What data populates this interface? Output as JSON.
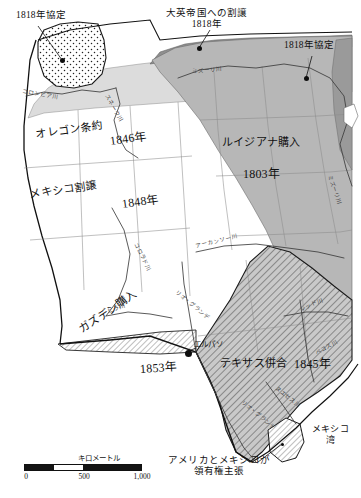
{
  "map": {
    "title_context": "United States territorial acquisitions map (Japanese)",
    "callouts": [
      {
        "id": "treaty-1818-nw",
        "line1": "1818年協定",
        "line2": "",
        "x": 16,
        "y": 10
      },
      {
        "id": "cession-to-britain",
        "line1": "大英帝国への割譲",
        "line2": "1818年",
        "x": 168,
        "y": 9
      },
      {
        "id": "treaty-1818-ne",
        "line1": "1818年協定",
        "line2": "",
        "x": 286,
        "y": 40
      },
      {
        "id": "us-mexico-claim",
        "line1": "アメリカとメキシコが",
        "line2": "領有権主張",
        "x": 178,
        "y": 455
      }
    ],
    "regions": [
      {
        "id": "oregon-treaty",
        "name": "オレゴン条約",
        "year": "1846年",
        "name_x": 36,
        "name_y": 126,
        "year_x": 108,
        "year_y": 133
      },
      {
        "id": "louisiana-purchase",
        "name": "ルイジアナ購入",
        "year": "1803年",
        "name_x": 224,
        "name_y": 139,
        "year_x": 244,
        "year_y": 170
      },
      {
        "id": "mexican-cession",
        "name": "メキシコ割譲",
        "year": "1848年",
        "name_x": 30,
        "name_y": 188,
        "year_x": 122,
        "year_y": 196
      },
      {
        "id": "gadsden-purchase",
        "name": "ガズデン購入",
        "year": "1853年",
        "name_x": 78,
        "name_y": 325,
        "year_x": 138,
        "year_y": 364
      },
      {
        "id": "texas-annexation",
        "name": "テキサス併合",
        "year": "1845年",
        "name_x": 222,
        "name_y": 360,
        "year_x": 294,
        "year_y": 360
      }
    ],
    "cities": [
      {
        "id": "el-paso",
        "label": "エルパソ",
        "x": 196,
        "y": 343,
        "dot_x": 189,
        "dot_y": 353
      }
    ],
    "water": [
      {
        "id": "gulf-of-mexico",
        "line1": "メキシコ",
        "line2": "湾",
        "x": 314,
        "y": 428
      }
    ],
    "rivers": [
      {
        "id": "columbia-river",
        "label": "コロンビア川",
        "x": 22,
        "y": 88,
        "rot": "rot-13"
      },
      {
        "id": "missouri-river-north",
        "label": "ミズーリ川",
        "x": 192,
        "y": 68,
        "rot": "rot-10"
      },
      {
        "id": "missouri-river-east",
        "label": "ミズーリ川",
        "x": 330,
        "y": 178,
        "rot": "rot-11"
      },
      {
        "id": "snake-river",
        "label": "スネーク川",
        "x": 104,
        "y": 92,
        "rot": "rot-4"
      },
      {
        "id": "arkansas-river",
        "label": "アーカンソー川",
        "x": 196,
        "y": 243,
        "rot": "rot-8"
      },
      {
        "id": "red-river",
        "label": "レッド川",
        "x": 300,
        "y": 310,
        "rot": "rot-6"
      },
      {
        "id": "colorado-river",
        "label": "コロラド川",
        "x": 137,
        "y": 243,
        "rot": "rot-7"
      },
      {
        "id": "gila-river",
        "label": "ヒラ川",
        "x": 108,
        "y": 310,
        "rot": "rot-1"
      },
      {
        "id": "rio-grande-north",
        "label": "リオ・グランデ",
        "x": 176,
        "y": 290,
        "rot": "rot-9"
      },
      {
        "id": "rio-grande-south",
        "label": "リオ・グランデ",
        "x": 242,
        "y": 400,
        "rot": "rot-9"
      },
      {
        "id": "nueces-river",
        "label": "ヌエセス川",
        "x": 276,
        "y": 386,
        "rot": "rot-9"
      },
      {
        "id": "pecos-river",
        "label": "ペコス川",
        "x": 316,
        "y": 352,
        "rot": "rot-12"
      }
    ],
    "scale": {
      "unit_label": "キロメートル",
      "ticks": [
        "0",
        "500",
        "1,000"
      ]
    },
    "colors": {
      "louisiana_fill": "#b7b7b7",
      "oregon_treaty_fill": "#dcdcdc",
      "mexican_cession_fill": "#ffffff",
      "british_cession_fill": "#8f8f8f",
      "far_east_fill": "#9a9a9a",
      "coast_line": "#111111",
      "ocean": "#ffffff"
    }
  }
}
